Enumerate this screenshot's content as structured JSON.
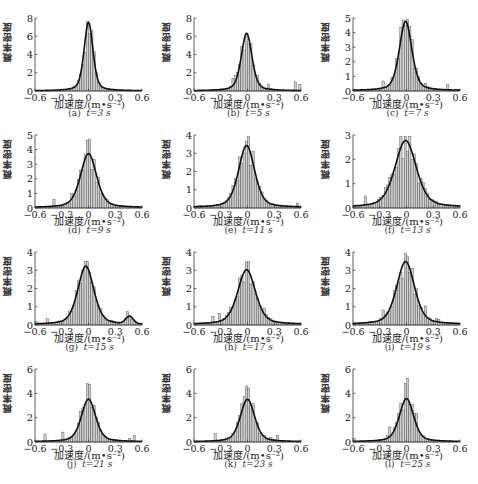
{
  "figure": {
    "caption": "",
    "panels": [
      {
        "id": "a",
        "label": "(a)",
        "t_label": "t=3 s"
      },
      {
        "id": "b",
        "label": "(b)",
        "t_label": "t=5 s"
      },
      {
        "id": "c",
        "label": "(c)",
        "t_label": "t=7 s"
      },
      {
        "id": "d",
        "label": "(d)",
        "t_label": "t=9 s"
      },
      {
        "id": "e",
        "label": "(e)",
        "t_label": "t=11 s"
      },
      {
        "id": "f",
        "label": "(f)",
        "t_label": "t=13 s"
      },
      {
        "id": "g",
        "label": "(g)",
        "t_label": "t=15 s"
      },
      {
        "id": "h",
        "label": "(h)",
        "t_label": "t=17 s"
      },
      {
        "id": "i",
        "label": "(i)",
        "t_label": "t=19 s"
      },
      {
        "id": "j",
        "label": "(j)",
        "t_label": "t=21 s"
      },
      {
        "id": "k",
        "label": "(k)",
        "t_label": "t=23 s"
      },
      {
        "id": "l",
        "label": "(l)",
        "t_label": "t=25 s"
      }
    ],
    "ylabel": "概率密度",
    "xlabel": "加速度/(m•s⁻²)",
    "colors": {
      "bar_fill": "#cfcfcf",
      "bar_stroke": "#444444",
      "curve": "#111111",
      "axis": "#333333"
    }
  },
  "chart_data": [
    {
      "type": "bar",
      "title": "(a) t=3 s",
      "xlabel": "加速度/(m•s⁻²)",
      "ylabel": "概率密度",
      "xlim": [
        -0.6,
        0.6
      ],
      "ylim": [
        0,
        8
      ],
      "yticks": [
        0,
        2,
        4,
        6,
        8
      ],
      "xticks": [
        -0.6,
        -0.3,
        0,
        0.3,
        0.6
      ],
      "curve": {
        "peak_x": 0.0,
        "peak_y": 7.5,
        "width": 0.05,
        "tail": 0.12
      },
      "hist_peak": 6.0,
      "hist_seed": 1
    },
    {
      "type": "bar",
      "title": "(b) t=5 s",
      "xlabel": "加速度/(m•s⁻²)",
      "ylabel": "概率密度",
      "xlim": [
        -0.6,
        0.6
      ],
      "ylim": [
        0,
        8
      ],
      "yticks": [
        0,
        2,
        4,
        6,
        8
      ],
      "xticks": [
        -0.6,
        -0.3,
        0,
        0.3,
        0.6
      ],
      "curve": {
        "peak_x": -0.01,
        "peak_y": 6.3,
        "width": 0.06,
        "tail": 0.15
      },
      "hist_peak": 6.5,
      "hist_seed": 2
    },
    {
      "type": "bar",
      "title": "(c) t=7 s",
      "xlabel": "加速度/(m•s⁻²)",
      "ylabel": "概率密度",
      "xlim": [
        -0.6,
        0.6
      ],
      "ylim": [
        0,
        5
      ],
      "yticks": [
        0,
        1,
        2,
        3,
        4,
        5
      ],
      "xticks": [
        -0.6,
        -0.3,
        0,
        0.3,
        0.6
      ],
      "curve": {
        "peak_x": -0.01,
        "peak_y": 4.75,
        "width": 0.07,
        "tail": 0.25
      },
      "hist_peak": 4.3,
      "hist_seed": 3
    },
    {
      "type": "bar",
      "title": "(d) t=9 s",
      "xlabel": "加速度/(m•s⁻²)",
      "ylabel": "概率密度",
      "xlim": [
        -0.6,
        0.6
      ],
      "ylim": [
        0,
        5
      ],
      "yticks": [
        0,
        1,
        2,
        3,
        4,
        5
      ],
      "xticks": [
        -0.6,
        -0.3,
        0,
        0.3,
        0.6
      ],
      "curve": {
        "peak_x": 0.0,
        "peak_y": 3.7,
        "width": 0.09,
        "tail": 0.3
      },
      "hist_peak": 4.8,
      "hist_seed": 4
    },
    {
      "type": "bar",
      "title": "(e) t=11 s",
      "xlabel": "加速度/(m•s⁻²)",
      "ylabel": "概率密度",
      "xlim": [
        -0.6,
        0.6
      ],
      "ylim": [
        0,
        4
      ],
      "yticks": [
        0,
        1,
        2,
        3,
        4
      ],
      "xticks": [
        -0.6,
        -0.3,
        0,
        0.3,
        0.6
      ],
      "curve": {
        "peak_x": -0.01,
        "peak_y": 3.4,
        "width": 0.09,
        "tail": 0.4
      },
      "hist_peak": 3.2,
      "hist_seed": 5
    },
    {
      "type": "bar",
      "title": "(f) t=13 s",
      "xlabel": "加速度/(m•s⁻²)",
      "ylabel": "概率密度",
      "xlim": [
        -0.6,
        0.6
      ],
      "ylim": [
        0,
        3
      ],
      "yticks": [
        0,
        1,
        2,
        3
      ],
      "xticks": [
        -0.6,
        -0.3,
        0,
        0.3,
        0.6
      ],
      "curve": {
        "peak_x": -0.01,
        "peak_y": 2.75,
        "width": 0.12,
        "tail": 0.45
      },
      "hist_peak": 2.7,
      "hist_seed": 6
    },
    {
      "type": "bar",
      "title": "(g) t=15 s",
      "xlabel": "加速度/(m•s⁻²)",
      "ylabel": "概率密度",
      "xlim": [
        -0.6,
        0.6
      ],
      "ylim": [
        0,
        4
      ],
      "yticks": [
        0,
        1,
        2,
        3,
        4
      ],
      "xticks": [
        -0.6,
        -0.3,
        0,
        0.3,
        0.6
      ],
      "curve": {
        "peak_x": -0.03,
        "peak_y": 3.2,
        "width": 0.09,
        "tail": 0.35,
        "secondary_peak": {
          "x": 0.46,
          "y": 0.4
        }
      },
      "hist_peak": 3.0,
      "hist_seed": 7
    },
    {
      "type": "bar",
      "title": "(h) t=17 s",
      "xlabel": "加速度/(m•s⁻²)",
      "ylabel": "概率密度",
      "xlim": [
        -0.6,
        0.6
      ],
      "ylim": [
        0,
        4
      ],
      "yticks": [
        0,
        1,
        2,
        3,
        4
      ],
      "xticks": [
        -0.6,
        -0.3,
        0,
        0.3,
        0.6
      ],
      "curve": {
        "peak_x": -0.01,
        "peak_y": 3.0,
        "width": 0.1,
        "tail": 0.5
      },
      "hist_peak": 3.7,
      "hist_seed": 8
    },
    {
      "type": "bar",
      "title": "(i) t=19 s",
      "xlabel": "加速度/(m•s⁻²)",
      "ylabel": "概率密度",
      "xlim": [
        -0.6,
        0.6
      ],
      "ylim": [
        0,
        4
      ],
      "yticks": [
        0,
        1,
        2,
        3,
        4
      ],
      "xticks": [
        -0.6,
        -0.3,
        0,
        0.3,
        0.6
      ],
      "curve": {
        "peak_x": -0.01,
        "peak_y": 3.45,
        "width": 0.1,
        "tail": 0.45
      },
      "hist_peak": 3.0,
      "hist_seed": 9
    },
    {
      "type": "bar",
      "title": "(j) t=21 s",
      "xlabel": "加速度/(m•s⁻²)",
      "ylabel": "概率密度",
      "xlim": [
        -0.6,
        0.6
      ],
      "ylim": [
        0,
        6
      ],
      "yticks": [
        0,
        2,
        4,
        6
      ],
      "xticks": [
        -0.6,
        -0.3,
        0,
        0.3,
        0.6
      ],
      "curve": {
        "peak_x": 0.0,
        "peak_y": 3.5,
        "width": 0.08,
        "tail": 0.3
      },
      "hist_peak": 4.8,
      "hist_seed": 10
    },
    {
      "type": "bar",
      "title": "(k) t=23 s",
      "xlabel": "加速度/(m•s⁻²)",
      "ylabel": "概率密度",
      "xlim": [
        -0.6,
        0.6
      ],
      "ylim": [
        0,
        6
      ],
      "yticks": [
        0,
        2,
        4,
        6
      ],
      "xticks": [
        -0.6,
        -0.3,
        0,
        0.3,
        0.6
      ],
      "curve": {
        "peak_x": 0.0,
        "peak_y": 3.5,
        "width": 0.08,
        "tail": 0.2
      },
      "hist_peak": 4.8,
      "hist_seed": 11
    },
    {
      "type": "bar",
      "title": "(l) t=25 s",
      "xlabel": "加速度/(m•s⁻²)",
      "ylabel": "概率密度",
      "xlim": [
        -0.6,
        0.6
      ],
      "ylim": [
        0,
        6
      ],
      "yticks": [
        0,
        2,
        4,
        6
      ],
      "xticks": [
        -0.6,
        -0.3,
        0,
        0.3,
        0.6
      ],
      "curve": {
        "peak_x": 0.0,
        "peak_y": 3.55,
        "width": 0.08,
        "tail": 0.3
      },
      "hist_peak": 5.5,
      "hist_seed": 12
    }
  ]
}
